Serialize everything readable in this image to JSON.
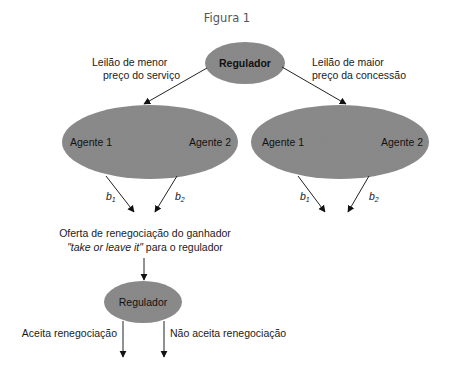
{
  "title": "Figura 1",
  "colors": {
    "node_fill": "#8a8a8a",
    "arrow": "#222222",
    "text": "#1a1a1a",
    "title": "#555555"
  },
  "nodes": {
    "top_regulator": {
      "label": "Regulador"
    },
    "left_auction": {
      "agent1": "Agente 1",
      "agent2": "Agente 2"
    },
    "right_auction": {
      "agent1": "Agente 1",
      "agent2": "Agente 2"
    },
    "bottom_regulator": {
      "label": "Regulador"
    }
  },
  "edges": {
    "left_branch": {
      "line1": "Leilão de menor",
      "line2": "preço do serviço"
    },
    "right_branch": {
      "line1": "Leilão de maior",
      "line2": "preço da concessão"
    },
    "bids": {
      "left_b1": {
        "base": "b",
        "sub": "1"
      },
      "left_b2": {
        "base": "b",
        "sub": "2"
      },
      "right_b1": {
        "base": "b",
        "sub": "1"
      },
      "right_b2": {
        "base": "b",
        "sub": "2"
      }
    },
    "renegotiation_offer": {
      "line1": "Oferta de renegociação do ganhador",
      "line2_italic": "\"take or leave it\"",
      "line2_rest": " para o regulador"
    },
    "accept": "Aceita renegociação",
    "reject": "Não aceita renegociação"
  }
}
